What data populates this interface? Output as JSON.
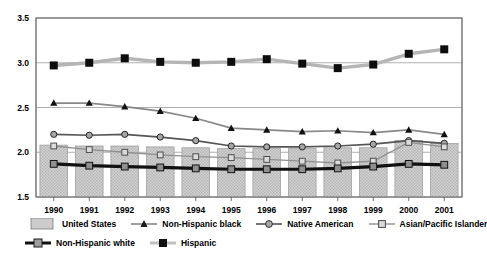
{
  "chart_data": {
    "type": "line",
    "title": "",
    "subtitle": "",
    "xlabel": "",
    "ylabel": "",
    "categories": [
      "1990",
      "1991",
      "1992",
      "1993",
      "1994",
      "1995",
      "1996",
      "1997",
      "1998",
      "1999",
      "2000",
      "2001"
    ],
    "ylim": [
      1.5,
      3.5
    ],
    "yticks": [
      1.5,
      2.0,
      2.5,
      3.0,
      3.5
    ],
    "ytick_labels": [
      "1.5",
      "2.0",
      "2.5",
      "3.0",
      "3.5"
    ],
    "grid": true,
    "legend_position": "bottom",
    "series": [
      {
        "name": "United States",
        "type": "bar",
        "marker": "none",
        "color": "#c9c9c9",
        "values": [
          2.08,
          2.07,
          2.07,
          2.06,
          2.05,
          2.04,
          2.04,
          2.04,
          2.05,
          2.05,
          2.13,
          2.1
        ]
      },
      {
        "name": "Non-Hispanic black",
        "type": "line",
        "marker": "triangle",
        "color": "#888888",
        "values": [
          2.55,
          2.55,
          2.51,
          2.46,
          2.38,
          2.27,
          2.25,
          2.23,
          2.24,
          2.22,
          2.25,
          2.2
        ]
      },
      {
        "name": "Native American",
        "type": "line",
        "marker": "circle",
        "color": "#555555",
        "values": [
          2.2,
          2.19,
          2.2,
          2.17,
          2.13,
          2.07,
          2.06,
          2.06,
          2.07,
          2.09,
          2.13,
          2.1
        ]
      },
      {
        "name": "Asian/Pacific Islander",
        "type": "line",
        "marker": "square-open",
        "color": "#909090",
        "values": [
          2.07,
          2.03,
          2.0,
          1.97,
          1.95,
          1.94,
          1.92,
          1.9,
          1.88,
          1.9,
          2.11,
          2.06
        ]
      },
      {
        "name": "Non-Hispanic white",
        "type": "line",
        "marker": "square",
        "color": "#111111",
        "values": [
          1.87,
          1.85,
          1.84,
          1.83,
          1.82,
          1.81,
          1.81,
          1.81,
          1.82,
          1.84,
          1.87,
          1.86
        ]
      },
      {
        "name": "Hispanic",
        "type": "line",
        "marker": "square-filled",
        "color": "#b5b5b5",
        "values": [
          2.97,
          3.0,
          3.05,
          3.01,
          3.0,
          3.01,
          3.04,
          2.99,
          2.94,
          2.98,
          3.1,
          3.15
        ]
      }
    ]
  },
  "legend": {
    "items": [
      {
        "label": "United States",
        "key": "bar-swatch"
      },
      {
        "label": "Non-Hispanic black",
        "key": "triangle-marker"
      },
      {
        "label": "Native American",
        "key": "circle-marker"
      },
      {
        "label": "Asian/Pacific Islander",
        "key": "square-open-marker"
      },
      {
        "label": "Non-Hispanic white",
        "key": "square-marker"
      },
      {
        "label": "Hispanic",
        "key": "square-filled-marker"
      }
    ]
  }
}
